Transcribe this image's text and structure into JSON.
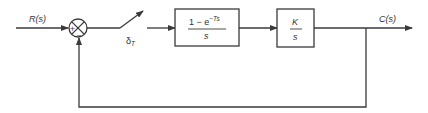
{
  "diagram": {
    "type": "block-diagram",
    "input": {
      "label": "R(s)"
    },
    "summing_junction": {
      "plus_sign": "+",
      "minus_sign": "−"
    },
    "sampler": {
      "label_main": "δ",
      "label_sub": "T"
    },
    "blocks": [
      {
        "id": "zoh",
        "numerator_main": "1 − e",
        "numerator_sup": "−Ts",
        "denominator": "s"
      },
      {
        "id": "plant",
        "numerator": "K",
        "denominator": "s"
      }
    ],
    "output": {
      "label": "C(s)"
    },
    "feedback": {
      "type": "unity",
      "sign": "negative"
    }
  }
}
